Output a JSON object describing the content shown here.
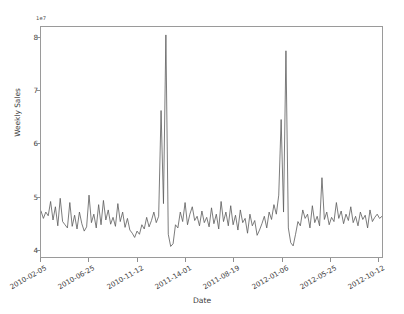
{
  "chart_data": {
    "type": "line",
    "title": "",
    "xlabel": "Date",
    "ylabel": "Weekly Sales",
    "y_offset_text": "1e7",
    "y_offset_mantissa": "1e",
    "y_offset_exponent": "7",
    "grid": false,
    "legend": null,
    "line_color": "#5a5a5a",
    "ylim": [
      3.85,
      8.2
    ],
    "yticks": [
      4,
      5,
      6,
      7,
      8
    ],
    "ytick_labels": [
      "4",
      "5",
      "6",
      "7",
      "8"
    ],
    "xtick_labels": [
      "2010-02-05",
      "2010-06-25",
      "2010-11-12",
      "2011-14-01",
      "2011-08-19",
      "2012-01-06",
      "2012-05-25",
      "2012-10-12"
    ],
    "xtick_index": [
      0,
      20,
      40,
      60,
      80,
      100,
      120,
      140
    ],
    "x_start": "2010-02-05",
    "x_end": "2012-10-26",
    "n_points": 143,
    "values": [
      4.72,
      4.58,
      4.7,
      4.63,
      4.9,
      4.55,
      4.8,
      4.44,
      4.96,
      4.52,
      4.46,
      4.4,
      4.88,
      4.43,
      4.64,
      4.38,
      4.7,
      4.48,
      4.34,
      4.42,
      5.02,
      4.5,
      4.66,
      4.4,
      4.84,
      4.46,
      4.92,
      4.55,
      4.74,
      4.47,
      4.6,
      4.43,
      4.86,
      4.52,
      4.7,
      4.41,
      4.58,
      4.36,
      4.3,
      4.22,
      4.34,
      4.28,
      4.46,
      4.38,
      4.6,
      4.42,
      4.54,
      4.7,
      4.5,
      4.62,
      6.62,
      4.86,
      8.05,
      4.28,
      4.05,
      4.1,
      4.46,
      4.4,
      4.7,
      4.52,
      4.88,
      4.46,
      4.66,
      4.8,
      4.54,
      4.62,
      4.44,
      4.72,
      4.5,
      4.6,
      4.42,
      4.78,
      4.48,
      4.66,
      4.38,
      4.9,
      4.52,
      4.7,
      4.44,
      4.82,
      4.46,
      4.64,
      4.36,
      4.74,
      4.5,
      4.58,
      4.3,
      4.66,
      4.44,
      4.54,
      4.26,
      4.36,
      4.48,
      4.62,
      4.4,
      4.7,
      4.56,
      4.84,
      4.66,
      5.02,
      6.45,
      4.7,
      7.75,
      4.4,
      4.12,
      4.06,
      4.28,
      4.52,
      4.44,
      4.74,
      4.58,
      4.66,
      4.4,
      4.82,
      4.5,
      4.62,
      4.44,
      5.35,
      4.56,
      4.7,
      4.46,
      4.6,
      4.52,
      4.88,
      4.58,
      4.72,
      4.48,
      4.66,
      4.54,
      4.8,
      4.5,
      4.62,
      4.44,
      4.7,
      4.56,
      4.64,
      4.4,
      4.74,
      4.52,
      4.6,
      4.66,
      4.58,
      4.62
    ]
  }
}
